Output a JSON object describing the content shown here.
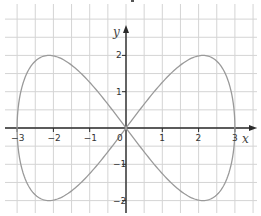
{
  "chart_data": {
    "type": "line",
    "title": "",
    "xlabel": "x",
    "ylabel": "y",
    "xlim": [
      -3.3,
      3.4
    ],
    "ylim": [
      -2.3,
      3.5
    ],
    "grid": true,
    "grid_step": 0.5,
    "x_ticks": [
      "-3",
      "-2",
      "-1",
      "0",
      "1",
      "2",
      "3"
    ],
    "y_ticks": [
      "2",
      "1",
      "-1",
      "-2"
    ],
    "origin_label": "0",
    "series": [
      {
        "name": "parametric curve x = 3cos t, y = 2sin 2t",
        "color": "#9a9a9a",
        "points": [
          [
            3,
            0
          ],
          [
            2.12,
            2
          ],
          [
            0,
            0
          ],
          [
            -2.12,
            -2
          ],
          [
            -3,
            0
          ],
          [
            -2.12,
            2
          ],
          [
            0,
            0
          ],
          [
            2.12,
            -2
          ],
          [
            3,
            0
          ]
        ]
      }
    ]
  },
  "colors": {
    "axis": "#2b2b2b",
    "grid": "#d4d4d4",
    "curve": "#9a9a9a"
  }
}
